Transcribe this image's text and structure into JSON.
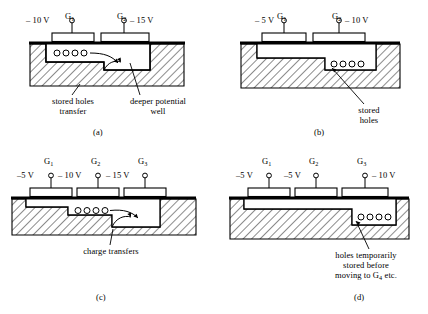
{
  "figure": {
    "colors": {
      "ink": "#000000",
      "background": "#ffffff",
      "hatch": "#000000",
      "oxide": "#000000"
    }
  },
  "panels": [
    {
      "id": "a",
      "letter": "(a)",
      "gates": [
        {
          "name": "G",
          "subscript": "1",
          "voltage": "– 10 V",
          "voltage_side": "left"
        },
        {
          "name": "G",
          "subscript": "2",
          "voltage": "– 15 V",
          "voltage_side": "right"
        }
      ],
      "holes_count": 4,
      "annotations": [
        {
          "id": "stored-holes-transfer",
          "lines": [
            "stored holes",
            "transfer"
          ]
        },
        {
          "id": "deeper-potential-well",
          "lines": [
            "deeper potential",
            "well"
          ]
        }
      ],
      "arrows": [
        "hole-transfer-arrow-1",
        "hole-transfer-arrow-2"
      ]
    },
    {
      "id": "b",
      "letter": "(b)",
      "gates": [
        {
          "name": "G",
          "subscript": "1",
          "voltage": "– 5 V",
          "voltage_side": "left"
        },
        {
          "name": "G",
          "subscript": "2",
          "voltage": "– 10 V",
          "voltage_side": "right"
        }
      ],
      "holes_count": 4,
      "annotations": [
        {
          "id": "stored-holes",
          "lines": [
            "stored",
            "holes"
          ]
        }
      ],
      "arrows": []
    },
    {
      "id": "c",
      "letter": "(c)",
      "gates": [
        {
          "name": "G",
          "subscript": "1",
          "voltage": "–5 V",
          "voltage_side": "left"
        },
        {
          "name": "G",
          "subscript": "2",
          "voltage": "– 10 V",
          "voltage_side": "left"
        },
        {
          "name": "G",
          "subscript": "3",
          "voltage": "– 15 V",
          "voltage_side": "left"
        }
      ],
      "holes_count": 4,
      "annotations": [
        {
          "id": "charge-transfers",
          "lines": [
            "charge transfers"
          ]
        }
      ],
      "arrows": [
        "charge-transfer-arrow-1",
        "charge-transfer-arrow-2"
      ]
    },
    {
      "id": "d",
      "letter": "(d)",
      "gates": [
        {
          "name": "G",
          "subscript": "1",
          "voltage": "–5 V",
          "voltage_side": "left"
        },
        {
          "name": "G",
          "subscript": "2",
          "voltage": "–5 V",
          "voltage_side": "left"
        },
        {
          "name": "G",
          "subscript": "3",
          "voltage": "– 10 V",
          "voltage_side": "right"
        }
      ],
      "holes_count": 4,
      "annotations": [
        {
          "id": "holes-temporarily-stored",
          "lines": [
            "holes temporarily",
            "stored before",
            "moving to G"
          ],
          "trailing_subscript": "4",
          "trailing_text": " etc."
        }
      ],
      "arrows": []
    }
  ]
}
